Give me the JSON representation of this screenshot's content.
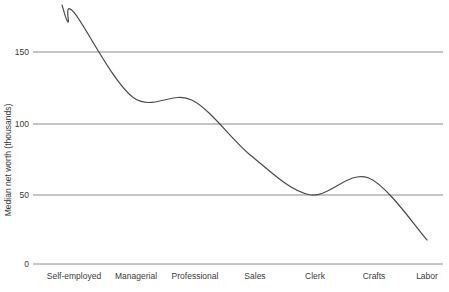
{
  "chart_data": {
    "type": "line",
    "title": "",
    "xlabel": "",
    "ylabel": "Median net worth (thousands)",
    "categories": [
      "Self-employed",
      "Managerial",
      "Professional",
      "Sales",
      "Clerk",
      "Crafts",
      "Labor"
    ],
    "values": [
      178,
      118,
      116,
      77,
      49,
      61,
      17
    ],
    "series": [
      {
        "name": "Median net worth",
        "values": [
          178,
          118,
          116,
          77,
          49,
          61,
          17
        ]
      }
    ],
    "yticks": [
      0,
      50,
      100,
      150
    ],
    "ytick_labels": [
      "0",
      "50",
      "100",
      "150"
    ],
    "ylim": [
      0,
      187
    ],
    "xlim": [
      0,
      6
    ],
    "grid": "horizontal",
    "legend": "none",
    "line_color": "#4a4a4a",
    "grid_color": "#8c8c8c",
    "axis_color": "#8c8c8c",
    "background": "#ffffff",
    "interpolation": "smooth-spline",
    "annotations": []
  },
  "axis": {
    "y_title": "Median net worth (thousands)",
    "ytick_0": "0",
    "ytick_50": "50",
    "ytick_100": "100",
    "ytick_150": "150"
  },
  "categories": {
    "c0": "Self-employed",
    "c1": "Managerial",
    "c2": "Professional",
    "c3": "Sales",
    "c4": "Clerk",
    "c5": "Crafts",
    "c6": "Labor"
  }
}
